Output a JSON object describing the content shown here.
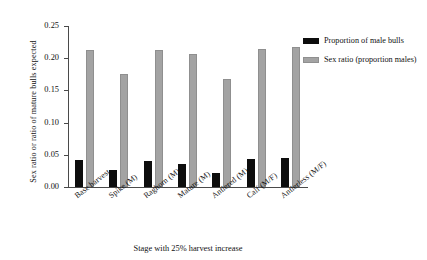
{
  "chart_data": {
    "type": "bar",
    "title": "",
    "xlabel": "Stage with 25% harvest increase",
    "ylabel": "Sex ratio or ratio of mature bulls expected",
    "ylim": [
      0.0,
      0.25
    ],
    "ytick_labels": [
      "0.25",
      "0.20",
      "0.15",
      "0.10",
      "0.05",
      "0.00"
    ],
    "ytick_values": [
      0.25,
      0.2,
      0.15,
      0.1,
      0.05,
      0.0
    ],
    "grid": false,
    "legend_position": "right",
    "categories": [
      "Base harvest",
      "Spike (M)",
      "Raghorn (M)",
      "Mature (M)",
      "Antlered (M)",
      "Calf (M/F)",
      "Antlerless (M/F)"
    ],
    "series": [
      {
        "name": "Proportion of male bulls",
        "color": "#0d0d0d",
        "values": [
          0.042,
          0.026,
          0.041,
          0.035,
          0.022,
          0.043,
          0.045
        ]
      },
      {
        "name": "Sex ratio (proportion males)",
        "color": "#a3a3a3",
        "values": [
          0.213,
          0.176,
          0.212,
          0.206,
          0.168,
          0.215,
          0.218
        ]
      }
    ]
  },
  "legend": {
    "entries": [
      {
        "label": "Proportion of male bulls",
        "swatch": "black"
      },
      {
        "label": "Sex ratio (proportion males)",
        "swatch": "grey"
      }
    ]
  }
}
